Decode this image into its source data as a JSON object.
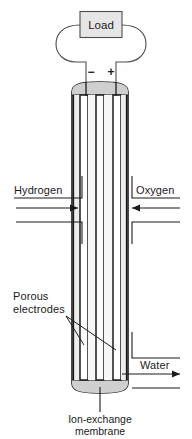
{
  "figure": {
    "background_color": "#ffffff",
    "line_color": "#1b1b1b",
    "fill_light": "#f2f2f2",
    "fill_mid": "#d9d9d9",
    "fill_electrode": "#ffffff"
  },
  "load": {
    "label": "Load",
    "box_fill": "#e6e6e6",
    "box_stroke": "#4d4d4d"
  },
  "terminals": {
    "negative": "−",
    "positive": "+"
  },
  "labels": {
    "hydrogen": "Hydrogen",
    "oxygen": "Oxygen",
    "porous_electrodes_line1": "Porous",
    "porous_electrodes_line2": "electrodes",
    "water": "Water",
    "membrane_line1": "Ion-exchange",
    "membrane_line2": "membrane"
  },
  "flows": [
    {
      "name": "hydrogen-inlet",
      "direction": "right",
      "label": "Hydrogen"
    },
    {
      "name": "oxygen-inlet",
      "direction": "left",
      "label": "Oxygen"
    },
    {
      "name": "water-outlet",
      "direction": "right",
      "label": "Water"
    }
  ],
  "components": [
    {
      "name": "load-resistor",
      "label": "Load"
    },
    {
      "name": "negative-terminal",
      "label": "−"
    },
    {
      "name": "positive-terminal",
      "label": "+"
    },
    {
      "name": "anode-electrode",
      "label": "Porous electrodes"
    },
    {
      "name": "cathode-electrode",
      "label": "Porous electrodes"
    },
    {
      "name": "ion-exchange-membrane",
      "label": "Ion-exchange membrane"
    }
  ]
}
